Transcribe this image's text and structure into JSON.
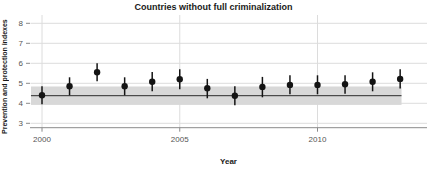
{
  "chart_data": {
    "type": "scatter",
    "title": "Countries without full criminalization",
    "xlabel": "Year",
    "ylabel": "Prevention and protection indexes",
    "x": [
      2000,
      2001,
      2002,
      2003,
      2004,
      2005,
      2006,
      2007,
      2008,
      2009,
      2010,
      2011,
      2012,
      2013
    ],
    "series": [
      {
        "name": "Point estimate with confidence interval",
        "values": [
          4.4,
          4.85,
          5.55,
          4.85,
          5.08,
          5.2,
          4.75,
          4.38,
          4.82,
          4.92,
          4.92,
          4.95,
          5.08,
          5.22
        ],
        "ci_low": [
          3.95,
          4.4,
          5.1,
          4.4,
          4.6,
          4.7,
          4.25,
          3.9,
          4.3,
          4.45,
          4.45,
          4.48,
          4.6,
          4.74
        ],
        "ci_high": [
          4.85,
          5.3,
          6.0,
          5.3,
          5.56,
          5.7,
          5.22,
          4.85,
          5.32,
          5.4,
          5.4,
          5.4,
          5.55,
          5.7
        ]
      }
    ],
    "reference_line": {
      "value": 4.38,
      "band": [
        3.92,
        4.84
      ],
      "band_x": [
        1999.6,
        2013.05
      ]
    },
    "x_ticks": [
      2000,
      2005,
      2010
    ],
    "y_ticks": [
      3,
      4,
      5,
      6,
      7,
      8
    ],
    "xlim": [
      1999.56,
      2013.97
    ],
    "ylim": [
      2.78,
      8.42
    ],
    "grid": true,
    "legend": false,
    "colors": {
      "point": "#141414",
      "error_bar": "#141414",
      "band": "#d8d8d8",
      "reference_line": "#2b2b2b",
      "grid": "#dcdcdc",
      "axis": "#8a8a8a",
      "tick_label": "#555555",
      "text": "#1a1a1a"
    }
  }
}
